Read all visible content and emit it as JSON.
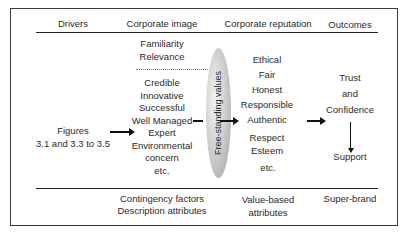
{
  "diagram": {
    "headers": {
      "drivers": "Drivers",
      "corporate_image": "Corporate image",
      "corporate_reputation": "Corporate reputation",
      "outcomes": "Outcomes"
    },
    "drivers": {
      "lines": [
        "Figures",
        "3.1 and 3.3 to 3.5"
      ]
    },
    "corporate_image": {
      "upper": [
        "Familiarity",
        "Relevance"
      ],
      "lower": [
        "Credible",
        "Innovative",
        "Successful",
        "Well Managed",
        "Expert",
        "Environmental",
        "concern",
        "etc."
      ]
    },
    "filter": {
      "label": "Free-standing values",
      "color": "#b8b8b8"
    },
    "corporate_reputation": {
      "group1": [
        "Ethical",
        "Fair",
        "Honest",
        "Responsible",
        "Authentic"
      ],
      "group2": [
        "Respect",
        "Esteem"
      ],
      "group3": [
        "etc."
      ]
    },
    "outcomes": {
      "lines": [
        "Trust",
        "and",
        "Confidence"
      ],
      "result": "Support"
    },
    "footers": {
      "corporate_image": [
        "Contingency factors",
        "Description attributes"
      ],
      "corporate_reputation": [
        "Value-based",
        "attributes"
      ],
      "outcomes": [
        "Super-brand"
      ]
    }
  }
}
